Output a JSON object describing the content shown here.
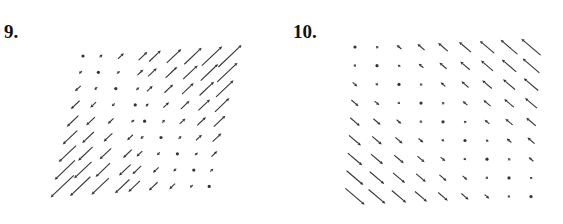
{
  "figures": [
    {
      "number_label": "9.",
      "description": "Vector field plot, sheared 9x9 grid; arrows along diagonal direction, up-right in upper-right region, down-left in lower-left region, zero along a diagonal"
    },
    {
      "number_label": "10.",
      "description": "Vector field plot, 9x9 grid; dots on main diagonal (top-left to bottom-right), arrows up-left above diagonal, down-right below, growing with distance from diagonal"
    }
  ],
  "chart_data": [
    {
      "type": "vector_field",
      "title": "9.",
      "grid": {
        "rows": 9,
        "cols": 9
      },
      "direction": "(1,1) scaled by (col - row); positive = up-right, negative = down-left",
      "magnitudes_by_row": [
        [
          0,
          1,
          2,
          3,
          4,
          5,
          6,
          7,
          8
        ],
        [
          -1,
          0,
          1,
          2,
          3,
          4,
          5,
          6,
          7
        ],
        [
          -2,
          -1,
          0,
          1,
          2,
          3,
          4,
          5,
          6
        ],
        [
          -3,
          -2,
          -1,
          0,
          1,
          2,
          3,
          4,
          5
        ],
        [
          -4,
          -3,
          -2,
          -1,
          0,
          1,
          2,
          3,
          4
        ],
        [
          -5,
          -4,
          -3,
          -2,
          -1,
          0,
          1,
          2,
          3
        ],
        [
          -6,
          -5,
          -4,
          -3,
          -2,
          -1,
          0,
          1,
          2
        ],
        [
          -7,
          -6,
          -5,
          -4,
          -3,
          -2,
          -1,
          0,
          1
        ],
        [
          -8,
          -7,
          -6,
          -5,
          -4,
          -3,
          -2,
          -1,
          0
        ]
      ],
      "axes": "none shown"
    },
    {
      "type": "vector_field",
      "title": "10.",
      "grid": {
        "rows": 9,
        "cols": 9
      },
      "direction": "(-1,1) scaled by (col - row); positive = up-left, negative = down-right; zero shown as dot on diagonal",
      "magnitudes_by_row": [
        [
          0,
          1,
          2,
          3,
          4,
          5,
          6,
          7,
          8
        ],
        [
          -1,
          0,
          1,
          2,
          3,
          4,
          5,
          6,
          7
        ],
        [
          -2,
          -1,
          0,
          1,
          2,
          3,
          4,
          5,
          6
        ],
        [
          -3,
          -2,
          -1,
          0,
          1,
          2,
          3,
          4,
          5
        ],
        [
          -4,
          -3,
          -2,
          -1,
          0,
          1,
          2,
          3,
          4
        ],
        [
          -5,
          -4,
          -3,
          -2,
          -1,
          0,
          1,
          2,
          3
        ],
        [
          -6,
          -5,
          -4,
          -3,
          -2,
          -1,
          0,
          1,
          2
        ],
        [
          -7,
          -6,
          -5,
          -4,
          -3,
          -2,
          -1,
          0,
          1
        ],
        [
          -8,
          -7,
          -6,
          -5,
          -4,
          -3,
          -2,
          -1,
          0
        ]
      ],
      "axes": "none shown"
    }
  ],
  "colors": {
    "ink": "#333333",
    "background": "#ffffff"
  }
}
